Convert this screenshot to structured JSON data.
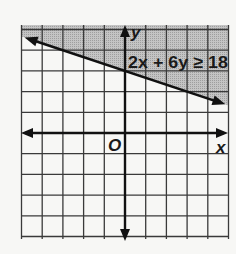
{
  "chart_data": {
    "type": "line",
    "title": "",
    "xlabel": "x",
    "ylabel": "y",
    "origin_label": "O",
    "xlim": [
      -5,
      5
    ],
    "ylim": [
      -5,
      5
    ],
    "grid": true,
    "grid_step": 1,
    "inequality": {
      "label": "2x + 6y ≥ 18",
      "a": 2,
      "b": 6,
      "c": 18,
      "operator": ">=",
      "boundary": "solid",
      "shaded_region": "above"
    },
    "boundary_line": {
      "equation": "y = 3 - x/3",
      "slope": -0.3333,
      "y_intercept": 3
    }
  },
  "colors": {
    "shade": "#b8b8b8",
    "grid": "#3a3a3a",
    "axis": "#111111",
    "background": "#f7f7f5"
  }
}
